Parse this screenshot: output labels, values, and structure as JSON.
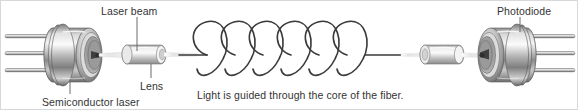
{
  "figure": {
    "background_color": "#ffffff",
    "border_color": "#d8d8d8",
    "width": 578,
    "height": 110
  },
  "labels": {
    "laser_beam": "Laser beam",
    "lens": "Lens",
    "semiconductor_laser": "Semiconductor laser",
    "photodiode": "Photodiode",
    "caption": "Light is guided through the core of the fiber."
  },
  "components": {
    "semiconductor_laser": {
      "name": "Semiconductor laser",
      "pin_count": 3,
      "body_color": "#b9b9b9",
      "highlight_color": "#f2f2f2",
      "shadow_color": "#6e6e6e"
    },
    "lens_left": {
      "name": "Lens",
      "body_color": "#cfcfcf",
      "highlight_color": "#f6f6f6"
    },
    "fiber_coil": {
      "name": "Optical fiber coil",
      "loops": 6,
      "stroke_color": "#3a3a3a",
      "stroke_width": 1.6
    },
    "lens_right": {
      "name": "Lens",
      "body_color": "#cfcfcf",
      "highlight_color": "#f6f6f6"
    },
    "photodiode": {
      "name": "Photodiode",
      "pin_count": 3,
      "body_color": "#b9b9b9",
      "highlight_color": "#f2f2f2",
      "shadow_color": "#6e6e6e"
    },
    "beam": {
      "name": "Laser beam",
      "color": "#e8e8e8"
    }
  },
  "leader_lines": {
    "laser_beam": {
      "x": 136,
      "y1": 16,
      "y2": 50
    },
    "lens": {
      "x": 150,
      "y1": 62,
      "y2": 78
    },
    "semiconductor_laser": {
      "x": 69,
      "y1": 80,
      "y2": 94
    },
    "photodiode": {
      "x": 519,
      "y1": 16,
      "y2": 30
    }
  },
  "colors": {
    "text": "#333333",
    "leader": "#6b6b6b",
    "metal_dark": "#5a5a5a",
    "metal_mid": "#a8a8a8",
    "metal_light": "#ededed"
  }
}
